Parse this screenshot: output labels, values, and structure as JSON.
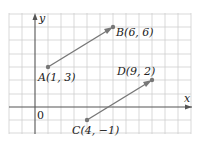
{
  "diagram": {
    "type": "coordinate-plane-vectors",
    "axes": {
      "x_label": "x",
      "y_label": "y",
      "origin_label": "0"
    },
    "grid": {
      "x_min": -2,
      "x_max": 12,
      "y_min": -2,
      "y_max": 7,
      "unit": 1
    },
    "points": [
      {
        "name": "A",
        "label": "A(1, 3)",
        "x": 1,
        "y": 3
      },
      {
        "name": "B",
        "label": "B(6, 6)",
        "x": 6,
        "y": 6
      },
      {
        "name": "C",
        "label": "C(4, −1)",
        "x": 4,
        "y": -1
      },
      {
        "name": "D",
        "label": "D(9, 2)",
        "x": 9,
        "y": 2
      }
    ],
    "vectors": [
      {
        "from": "A",
        "to": "B"
      },
      {
        "from": "C",
        "to": "D"
      }
    ],
    "colors": {
      "grid": "#c8c8c8",
      "axis": "#555555",
      "vector": "#777777",
      "point": "#777777"
    }
  }
}
